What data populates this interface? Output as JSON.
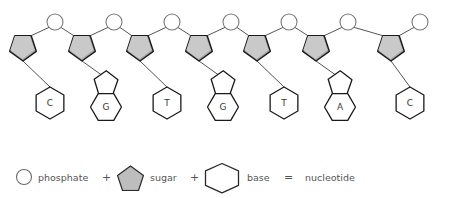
{
  "diagram": {
    "colors": {
      "sugar_fill": "#a8a8a8",
      "sugar_fill_light": "#c9c9c9",
      "outline": "#555555",
      "outline_dark": "#1a1a1a",
      "shape_fill": "#ffffff",
      "text": "#3a3a3a",
      "legend_text": "#555555",
      "background": "#ffffff"
    },
    "backbone": {
      "unit_count": 7,
      "phosphate_shape": "circle",
      "sugar_shape": "pentagon",
      "units": [
        {
          "index": 1,
          "base_label": "C",
          "base_type": "pyrimidine",
          "phosphate_x": 55,
          "sugar_x": 23,
          "base_x": 50
        },
        {
          "index": 2,
          "base_label": "G",
          "base_type": "purine",
          "phosphate_x": 114,
          "sugar_x": 82,
          "base_x": 110
        },
        {
          "index": 3,
          "base_label": "T",
          "base_type": "pyrimidine",
          "phosphate_x": 172,
          "sugar_x": 140,
          "base_x": 167
        },
        {
          "index": 4,
          "base_label": "G",
          "base_type": "purine",
          "phosphate_x": 231,
          "sugar_x": 199,
          "base_x": 227
        },
        {
          "index": 5,
          "base_label": "T",
          "base_type": "pyrimidine",
          "phosphate_x": 289,
          "sugar_x": 257,
          "base_x": 284
        },
        {
          "index": 6,
          "base_label": "A",
          "base_type": "purine",
          "phosphate_x": 348,
          "sugar_x": 316,
          "base_x": 344
        },
        {
          "index": 7,
          "base_label": "C",
          "base_type": "pyrimidine",
          "phosphate_x": 420,
          "sugar_x": 391,
          "base_x": 410
        }
      ],
      "sequence": [
        "C",
        "G",
        "T",
        "G",
        "T",
        "A",
        "C"
      ]
    },
    "legend": {
      "phosphate_label": "phosphate",
      "plus_one": "+",
      "sugar_label": "sugar",
      "plus_two": "+",
      "base_label": "base",
      "equals": "=",
      "result_label": "nucleotide"
    }
  }
}
